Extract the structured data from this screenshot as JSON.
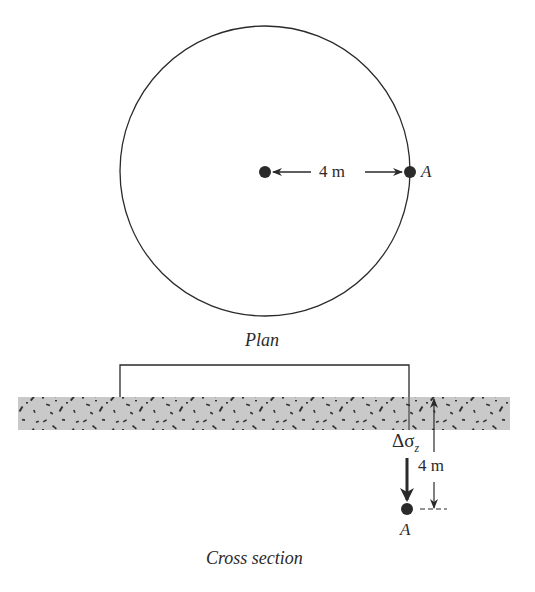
{
  "plan": {
    "caption": "Plan",
    "radius_label": "4 m",
    "point_label": "A"
  },
  "cross_section": {
    "caption": "Cross section",
    "stress_label_delta": "Δσ",
    "stress_label_sub": "z",
    "depth_label": "4 m",
    "point_label": "A"
  },
  "colors": {
    "line": "#2a2a2a",
    "soil_fill": "#c9c9c9",
    "grain": "#333333"
  }
}
